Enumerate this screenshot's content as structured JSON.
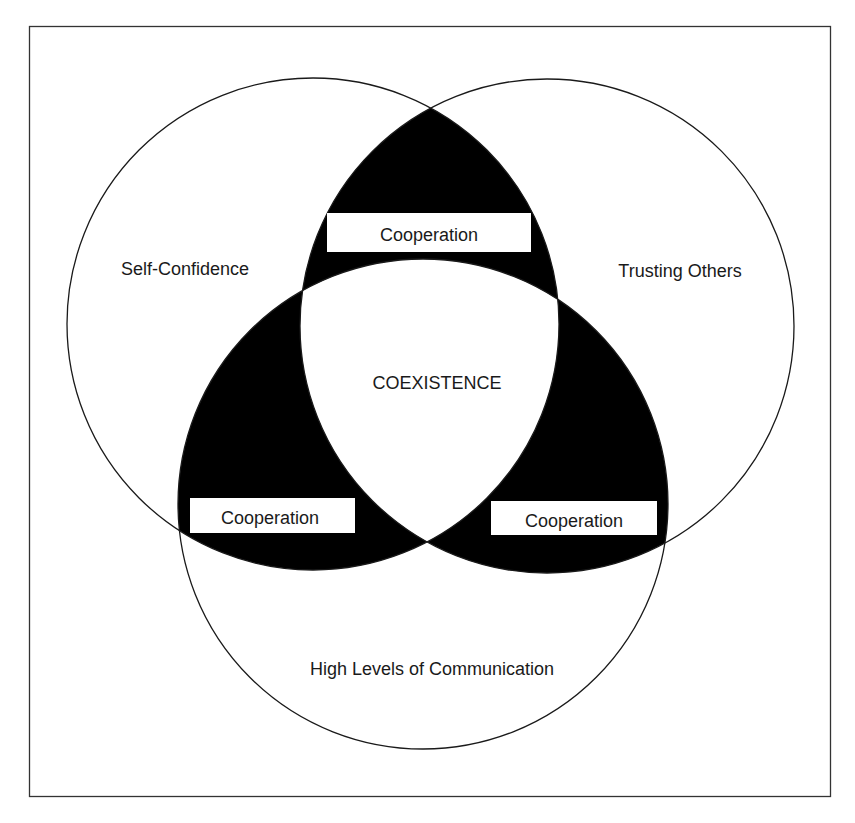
{
  "diagram": {
    "type": "venn",
    "frame": {
      "x": 29,
      "y": 26,
      "width": 801,
      "height": 770
    },
    "circles": [
      {
        "id": "self-confidence",
        "label": "Self-Confidence",
        "cx": 313,
        "cy": 324,
        "r": 246
      },
      {
        "id": "trusting-others",
        "label": "Trusting Others",
        "cx": 547,
        "cy": 326,
        "r": 247
      },
      {
        "id": "communication",
        "label": "High Levels of Communication",
        "cx": 423,
        "cy": 504,
        "r": 245
      }
    ],
    "center_label": "COEXISTENCE",
    "overlap_labels": [
      {
        "id": "top",
        "text": "Cooperation",
        "between": [
          "Self-Confidence",
          "Trusting Others"
        ]
      },
      {
        "id": "left",
        "text": "Cooperation",
        "between": [
          "Self-Confidence",
          "High Levels of Communication"
        ]
      },
      {
        "id": "right",
        "text": "Cooperation",
        "between": [
          "Trusting Others",
          "High Levels of Communication"
        ]
      }
    ],
    "colors": {
      "stroke": "#1a1a1a",
      "overlap_fill": "#000000",
      "background": "#ffffff"
    }
  }
}
